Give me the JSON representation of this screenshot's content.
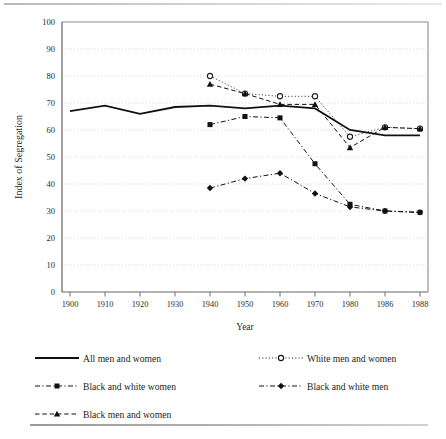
{
  "figure": {
    "y_axis_title": "Index of Segregation",
    "x_axis_title": "Year"
  },
  "legend": {
    "items": [
      {
        "label": "All men and women",
        "style": "solid",
        "marker": "none",
        "name": "legend-all-men-and-women"
      },
      {
        "label": "White men and women",
        "style": "dotted",
        "marker": "open-circle",
        "name": "legend-white-men-and-women"
      },
      {
        "label": "Black and white women",
        "style": "dash-dot",
        "marker": "filled-square",
        "name": "legend-black-and-white-women"
      },
      {
        "label": "Black and white men",
        "style": "dash-dot",
        "marker": "filled-diamond",
        "name": "legend-black-and-white-men"
      },
      {
        "label": "Black men and women",
        "style": "dashed",
        "marker": "filled-triangle",
        "name": "legend-black-men-and-women"
      }
    ]
  },
  "chart_data": {
    "type": "line",
    "title": "",
    "xlabel": "Year",
    "ylabel": "Index of Segregation",
    "ylim": [
      0,
      100
    ],
    "ytick_step": 10,
    "yticks": [
      0,
      10,
      20,
      30,
      40,
      50,
      60,
      70,
      80,
      90,
      100
    ],
    "grid": "horizontal-dotted",
    "legend_position": "below",
    "categories": [
      "1900",
      "1910",
      "1920",
      "1930",
      "1940",
      "1950",
      "1960",
      "1970",
      "1980",
      "1986",
      "1988"
    ],
    "series": [
      {
        "name": "All men and women",
        "marker": "none",
        "linestyle": "solid",
        "color": "#111111",
        "values": [
          67,
          69,
          66,
          68.5,
          69,
          68,
          69,
          68,
          60,
          58,
          58
        ]
      },
      {
        "name": "White men and women",
        "marker": "open-circle",
        "linestyle": "dotted",
        "color": "#222222",
        "values": [
          null,
          null,
          null,
          null,
          80,
          73.5,
          72.5,
          72.5,
          57.5,
          61,
          60.5
        ]
      },
      {
        "name": "Black and white women",
        "marker": "filled-square",
        "linestyle": "dash-dot",
        "color": "#111111",
        "values": [
          null,
          null,
          null,
          null,
          62,
          65,
          64.5,
          47.5,
          32.5,
          30,
          29.5
        ]
      },
      {
        "name": "Black and white men",
        "marker": "filled-diamond",
        "linestyle": "dash-dot",
        "color": "#111111",
        "values": [
          null,
          null,
          null,
          null,
          38.5,
          42,
          44,
          36.5,
          31.5,
          30,
          29.5
        ]
      },
      {
        "name": "Black men and women",
        "marker": "filled-triangle",
        "linestyle": "dashed",
        "color": "#111111",
        "values": [
          null,
          null,
          null,
          null,
          77,
          73.5,
          69.5,
          69.5,
          53.5,
          61,
          60.5
        ]
      }
    ]
  }
}
